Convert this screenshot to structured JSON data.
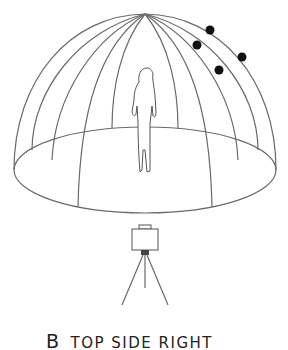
{
  "caption": {
    "letter": "B",
    "label": "TOP SIDE RIGHT"
  },
  "figure": {
    "enclosure": "geodesic-light-dome",
    "lights": 4,
    "camera": "tripod-camera"
  }
}
